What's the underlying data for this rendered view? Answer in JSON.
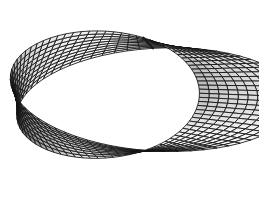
{
  "figure": {
    "background_color": "#ffffff",
    "line_color": "#111111",
    "seam_color": "#1a1a1a",
    "shading": {
      "min_gray": "#4a4a4a",
      "mid_gray": "#a8a8a8",
      "max_gray": "#ffffff"
    },
    "canvas": {
      "width": 259,
      "height": 197
    }
  },
  "geometry": {
    "surface_type": "mobius-strip",
    "half_twists": 1,
    "major_radius": 1.0,
    "strip_half_width": 0.42,
    "mesh_u_segments": 72,
    "mesh_v_segments": 10,
    "projection": {
      "type": "oblique-orthographic",
      "center_x": 132,
      "center_y": 97,
      "scale_x": 116,
      "scale_y": 116,
      "tilt_y_factor": 0.47,
      "height_factor": 0.62,
      "rotation_deg": 8
    },
    "light_direction": [
      -0.35,
      -0.55,
      0.76
    ],
    "ambient": 0.17,
    "seam_u_index": 54
  },
  "extents": {
    "left_px": 6,
    "right_px": 250,
    "top_px": 10,
    "bottom_px": 187,
    "inner_hole_center_x": 134,
    "inner_hole_center_y": 95,
    "inner_hole_radius_x": 64,
    "inner_hole_radius_y": 41
  }
}
